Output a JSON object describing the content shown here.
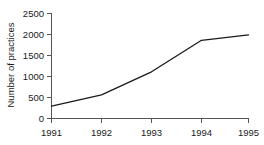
{
  "chart_data": {
    "type": "line",
    "title": "",
    "xlabel": "",
    "ylabel": "Number of practices",
    "x": [
      1991,
      1992,
      1993,
      1994,
      1995
    ],
    "categories": [
      "1991",
      "1992",
      "1993",
      "1994",
      "1995"
    ],
    "values": [
      280,
      550,
      1100,
      1850,
      1980
    ],
    "series": [
      {
        "name": "Number of practices",
        "values": [
          280,
          550,
          1100,
          1850,
          1980
        ]
      }
    ],
    "xlim": [
      1991,
      1995
    ],
    "ylim": [
      0,
      2500
    ],
    "ytick_labels": [
      "0",
      "500",
      "1000",
      "1500",
      "2000",
      "2500"
    ],
    "ytick_values": [
      0,
      500,
      1000,
      1500,
      2000,
      2500
    ],
    "xtick_labels": [
      "1991",
      "1992",
      "1993",
      "1994",
      "1995"
    ],
    "grid": false,
    "legend": false,
    "line_color": "#1a1a1a",
    "axis_color": "#555555"
  },
  "axes": {
    "y_title": "Number of practices",
    "y_ticks": [
      {
        "label": "2500"
      },
      {
        "label": "2000"
      },
      {
        "label": "1500"
      },
      {
        "label": "1000"
      },
      {
        "label": "500"
      },
      {
        "label": "0"
      }
    ],
    "x_ticks": [
      {
        "label": "1991"
      },
      {
        "label": "1992"
      },
      {
        "label": "1993"
      },
      {
        "label": "1994"
      },
      {
        "label": "1995"
      }
    ]
  }
}
